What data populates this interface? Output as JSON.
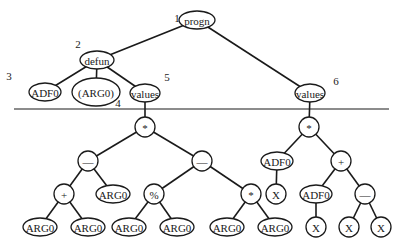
{
  "diagram": {
    "type": "program-tree",
    "nodes": [
      {
        "id": "progn",
        "label": "progn",
        "shape": "ellipse"
      },
      {
        "id": "defun",
        "label": "defun",
        "shape": "ellipse"
      },
      {
        "id": "adf0_name",
        "label": "ADF0",
        "shape": "ellipse"
      },
      {
        "id": "arglist",
        "label": "(ARG0)",
        "shape": "ellipse"
      },
      {
        "id": "values_adf",
        "label": "values",
        "shape": "ellipse"
      },
      {
        "id": "values_rpb",
        "label": "values",
        "shape": "ellipse"
      },
      {
        "id": "mul_adf",
        "label": "*",
        "shape": "circle"
      },
      {
        "id": "sub_left",
        "label": "—",
        "shape": "circle"
      },
      {
        "id": "sub_right",
        "label": "—",
        "shape": "circle"
      },
      {
        "id": "plus_adf",
        "label": "+",
        "shape": "circle"
      },
      {
        "id": "arg0_a",
        "label": "ARG0",
        "shape": "ellipse"
      },
      {
        "id": "mod_adf",
        "label": "%",
        "shape": "circle"
      },
      {
        "id": "mul_adf2",
        "label": "*",
        "shape": "circle"
      },
      {
        "id": "arg0_b",
        "label": "ARG0",
        "shape": "ellipse"
      },
      {
        "id": "arg0_c",
        "label": "ARG0",
        "shape": "ellipse"
      },
      {
        "id": "arg0_d",
        "label": "ARG0",
        "shape": "ellipse"
      },
      {
        "id": "arg0_e",
        "label": "ARG0",
        "shape": "ellipse"
      },
      {
        "id": "arg0_f",
        "label": "ARG0",
        "shape": "ellipse"
      },
      {
        "id": "arg0_g",
        "label": "ARG0",
        "shape": "ellipse"
      },
      {
        "id": "mul_rpb",
        "label": "*",
        "shape": "circle"
      },
      {
        "id": "adf0_call1",
        "label": "ADF0",
        "shape": "ellipse"
      },
      {
        "id": "plus_rpb",
        "label": "+",
        "shape": "circle"
      },
      {
        "id": "x1",
        "label": "X",
        "shape": "circle"
      },
      {
        "id": "adf0_call2",
        "label": "ADF0",
        "shape": "ellipse"
      },
      {
        "id": "sub_rpb",
        "label": "—",
        "shape": "circle"
      },
      {
        "id": "x2",
        "label": "X",
        "shape": "circle"
      },
      {
        "id": "x3",
        "label": "X",
        "shape": "circle"
      },
      {
        "id": "x4",
        "label": "X",
        "shape": "circle"
      }
    ],
    "edges": [
      [
        "progn",
        "defun"
      ],
      [
        "progn",
        "values_rpb"
      ],
      [
        "defun",
        "adf0_name"
      ],
      [
        "defun",
        "arglist"
      ],
      [
        "defun",
        "values_adf"
      ],
      [
        "values_adf",
        "mul_adf"
      ],
      [
        "mul_adf",
        "sub_left"
      ],
      [
        "mul_adf",
        "sub_right"
      ],
      [
        "sub_left",
        "plus_adf"
      ],
      [
        "sub_left",
        "arg0_a"
      ],
      [
        "plus_adf",
        "arg0_b"
      ],
      [
        "plus_adf",
        "arg0_c"
      ],
      [
        "sub_right",
        "mod_adf"
      ],
      [
        "sub_right",
        "mul_adf2"
      ],
      [
        "mod_adf",
        "arg0_d"
      ],
      [
        "mod_adf",
        "arg0_e"
      ],
      [
        "mul_adf2",
        "arg0_f"
      ],
      [
        "mul_adf2",
        "arg0_g"
      ],
      [
        "values_rpb",
        "mul_rpb"
      ],
      [
        "mul_rpb",
        "adf0_call1"
      ],
      [
        "mul_rpb",
        "plus_rpb"
      ],
      [
        "adf0_call1",
        "x1"
      ],
      [
        "plus_rpb",
        "adf0_call2"
      ],
      [
        "plus_rpb",
        "sub_rpb"
      ],
      [
        "adf0_call2",
        "x2"
      ],
      [
        "sub_rpb",
        "x3"
      ],
      [
        "sub_rpb",
        "x4"
      ]
    ],
    "annotations": [
      {
        "label": "1",
        "near": "progn"
      },
      {
        "label": "2",
        "near": "defun"
      },
      {
        "label": "3",
        "near": "adf0_name"
      },
      {
        "label": "4",
        "near": "arglist"
      },
      {
        "label": "5",
        "near": "values_adf"
      },
      {
        "label": "6",
        "near": "values_rpb"
      }
    ]
  }
}
